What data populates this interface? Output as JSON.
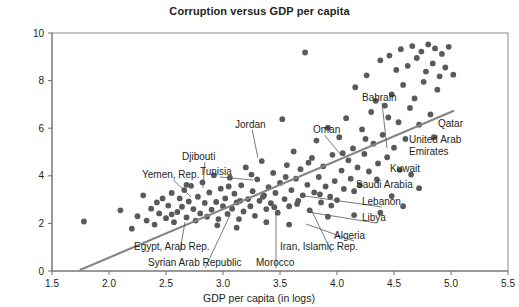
{
  "chart_data": {
    "type": "scatter",
    "title": "Corruption versus GDP per capita",
    "xlabel": "GDP per capita (in logs)",
    "ylabel": "",
    "xlim": [
      1.5,
      5.5
    ],
    "ylim": [
      0,
      10
    ],
    "xticks": [
      "1.5",
      "2.0",
      "2.5",
      "3.0",
      "3.5",
      "4.0",
      "4.5",
      "5.0",
      "5.5"
    ],
    "xtick_values": [
      1.5,
      2.0,
      2.5,
      3.0,
      3.5,
      4.0,
      4.5,
      5.0,
      5.5
    ],
    "yticks": [
      "0",
      "2",
      "4",
      "6",
      "8",
      "10"
    ],
    "ytick_values": [
      0,
      2,
      4,
      6,
      8,
      10
    ],
    "grid": false,
    "legend": "none",
    "marker_color": "#5a5a5a",
    "trend_color": "#848484",
    "trendline": {
      "x": [
        1.75,
        5.02
      ],
      "y": [
        0.05,
        6.72
      ]
    },
    "points": [
      [
        1.78,
        2.08
      ],
      [
        2.1,
        2.55
      ],
      [
        2.2,
        1.78
      ],
      [
        2.25,
        2.3
      ],
      [
        2.33,
        2.12
      ],
      [
        2.37,
        2.62
      ],
      [
        2.4,
        1.95
      ],
      [
        2.44,
        2.42
      ],
      [
        2.47,
        3.05
      ],
      [
        2.5,
        2.22
      ],
      [
        2.52,
        2.75
      ],
      [
        2.55,
        3.28
      ],
      [
        2.57,
        2.05
      ],
      [
        2.6,
        2.48
      ],
      [
        2.62,
        3.05
      ],
      [
        2.64,
        2.7
      ],
      [
        2.66,
        3.4
      ],
      [
        2.68,
        2.25
      ],
      [
        2.7,
        2.92
      ],
      [
        2.72,
        3.58
      ],
      [
        2.74,
        2.6
      ],
      [
        2.76,
        2.12
      ],
      [
        2.78,
        3.12
      ],
      [
        2.8,
        2.42
      ],
      [
        2.82,
        3.72
      ],
      [
        2.84,
        2.86
      ],
      [
        2.86,
        2.28
      ],
      [
        2.88,
        3.3
      ],
      [
        2.9,
        2.58
      ],
      [
        2.92,
        4.02
      ],
      [
        2.94,
        2.9
      ],
      [
        2.96,
        2.18
      ],
      [
        2.98,
        3.46
      ],
      [
        3.0,
        2.72
      ],
      [
        3.02,
        3.05
      ],
      [
        3.04,
        2.4
      ],
      [
        3.06,
        3.92
      ],
      [
        3.08,
        2.62
      ],
      [
        3.1,
        3.25
      ],
      [
        3.12,
        2.88
      ],
      [
        3.14,
        2.18
      ],
      [
        3.16,
        3.6
      ],
      [
        3.18,
        2.5
      ],
      [
        3.2,
        4.35
      ],
      [
        3.22,
        3.02
      ],
      [
        3.24,
        2.72
      ],
      [
        3.26,
        3.35
      ],
      [
        3.28,
        2.32
      ],
      [
        3.3,
        3.85
      ],
      [
        3.32,
        2.95
      ],
      [
        3.34,
        4.62
      ],
      [
        3.36,
        3.18
      ],
      [
        3.38,
        2.6
      ],
      [
        3.4,
        3.52
      ],
      [
        3.42,
        2.85
      ],
      [
        3.44,
        4.12
      ],
      [
        3.46,
        3.28
      ],
      [
        3.48,
        2.45
      ],
      [
        3.5,
        3.7
      ],
      [
        3.52,
        6.38
      ],
      [
        3.54,
        3.02
      ],
      [
        3.56,
        4.45
      ],
      [
        3.58,
        2.72
      ],
      [
        3.6,
        3.4
      ],
      [
        3.62,
        5.02
      ],
      [
        3.64,
        3.88
      ],
      [
        3.66,
        2.95
      ],
      [
        3.68,
        4.28
      ],
      [
        3.7,
        3.18
      ],
      [
        3.72,
        9.18
      ],
      [
        3.74,
        3.62
      ],
      [
        3.76,
        2.55
      ],
      [
        3.78,
        4.75
      ],
      [
        3.8,
        3.3
      ],
      [
        3.82,
        5.48
      ],
      [
        3.84,
        3.95
      ],
      [
        3.86,
        2.88
      ],
      [
        3.88,
        4.4
      ],
      [
        3.9,
        3.55
      ],
      [
        3.92,
        6.02
      ],
      [
        3.94,
        3.12
      ],
      [
        3.96,
        4.88
      ],
      [
        3.98,
        3.78
      ],
      [
        4.0,
        2.98
      ],
      [
        4.02,
        5.62
      ],
      [
        4.04,
        4.22
      ],
      [
        4.06,
        3.45
      ],
      [
        4.08,
        6.42
      ],
      [
        4.1,
        4.65
      ],
      [
        4.12,
        3.88
      ],
      [
        4.14,
        5.15
      ],
      [
        4.16,
        7.72
      ],
      [
        4.18,
        4.35
      ],
      [
        4.2,
        3.62
      ],
      [
        4.22,
        5.95
      ],
      [
        4.24,
        4.92
      ],
      [
        4.26,
        8.22
      ],
      [
        4.28,
        4.18
      ],
      [
        4.3,
        6.68
      ],
      [
        4.32,
        5.35
      ],
      [
        4.34,
        7.15
      ],
      [
        4.36,
        4.52
      ],
      [
        4.38,
        8.85
      ],
      [
        4.4,
        5.72
      ],
      [
        4.42,
        6.95
      ],
      [
        4.44,
        4.78
      ],
      [
        4.46,
        9.05
      ],
      [
        4.48,
        7.42
      ],
      [
        4.5,
        5.18
      ],
      [
        4.52,
        8.45
      ],
      [
        4.54,
        6.25
      ],
      [
        4.56,
        9.32
      ],
      [
        4.58,
        7.82
      ],
      [
        4.6,
        5.55
      ],
      [
        4.62,
        8.62
      ],
      [
        4.64,
        6.85
      ],
      [
        4.66,
        9.45
      ],
      [
        4.68,
        7.25
      ],
      [
        4.7,
        8.95
      ],
      [
        4.72,
        6.15
      ],
      [
        4.74,
        9.22
      ],
      [
        4.76,
        7.95
      ],
      [
        4.78,
        8.38
      ],
      [
        4.8,
        9.52
      ],
      [
        4.82,
        6.58
      ],
      [
        4.84,
        8.72
      ],
      [
        4.86,
        9.35
      ],
      [
        4.88,
        7.62
      ],
      [
        4.9,
        8.18
      ],
      [
        4.92,
        9.12
      ],
      [
        4.95,
        8.55
      ],
      [
        4.98,
        9.42
      ],
      [
        5.02,
        8.25
      ],
      [
        2.3,
        3.18
      ],
      [
        2.42,
        2.88
      ],
      [
        2.55,
        2.38
      ],
      [
        2.68,
        3.62
      ],
      [
        3.05,
        3.55
      ],
      [
        3.15,
        2.95
      ],
      [
        3.25,
        4.05
      ],
      [
        3.35,
        3.12
      ],
      [
        3.45,
        2.68
      ],
      [
        3.55,
        3.95
      ],
      [
        3.65,
        2.82
      ],
      [
        3.75,
        4.55
      ],
      [
        3.85,
        3.22
      ],
      [
        3.95,
        2.75
      ],
      [
        4.05,
        4.95
      ],
      [
        4.15,
        3.35
      ],
      [
        4.25,
        5.55
      ],
      [
        4.35,
        3.85
      ],
      [
        4.45,
        6.45
      ],
      [
        4.55,
        4.25
      ],
      [
        2.95,
        1.92
      ],
      [
        3.12,
        1.82
      ],
      [
        3.38,
        2.05
      ],
      [
        3.58,
        1.95
      ],
      [
        4.38,
        2.45
      ],
      [
        4.48,
        3.15
      ],
      [
        4.58,
        2.72
      ],
      [
        4.15,
        2.35
      ],
      [
        3.92,
        2.28
      ],
      [
        4.65,
        4.05
      ],
      [
        4.72,
        3.48
      ],
      [
        4.85,
        5.62
      ]
    ],
    "annotations": [
      {
        "label": "Bahrain",
        "lx": 362,
        "ly": 101,
        "anchor": "start",
        "px": 387,
        "py": 148,
        "leader": true
      },
      {
        "label": "Qatar",
        "lx": 438,
        "ly": 127,
        "anchor": "start",
        "px": 432,
        "py": 131,
        "leader": false
      },
      {
        "label": "United Arab",
        "lx": 409,
        "ly": 143,
        "anchor": "start",
        "px": 0,
        "py": 0,
        "leader": false
      },
      {
        "label": "Emirates",
        "lx": 409,
        "ly": 155,
        "anchor": "start",
        "px": 0,
        "py": 0,
        "leader": false
      },
      {
        "label": "Kuwait",
        "lx": 390,
        "ly": 172,
        "anchor": "start",
        "px": 385,
        "py": 169,
        "leader": false
      },
      {
        "label": "Saudi Arabia",
        "lx": 356,
        "ly": 188,
        "anchor": "start",
        "px": 351,
        "py": 185,
        "leader": false
      },
      {
        "label": "Oman",
        "lx": 313,
        "ly": 133,
        "anchor": "start",
        "px": 341,
        "py": 155,
        "leader": true
      },
      {
        "label": "Jordan",
        "lx": 235,
        "ly": 128,
        "anchor": "start",
        "px": 258,
        "py": 158,
        "leader": true
      },
      {
        "label": "Lebanon",
        "lx": 362,
        "ly": 205,
        "anchor": "start",
        "px": 305,
        "py": 196,
        "leader": true
      },
      {
        "label": "Libya",
        "lx": 362,
        "ly": 221,
        "anchor": "start",
        "px": 308,
        "py": 212,
        "leader": true
      },
      {
        "label": "Algeria",
        "lx": 334,
        "ly": 239,
        "anchor": "start",
        "px": 306,
        "py": 224,
        "leader": true
      },
      {
        "label": "Tunisia",
        "lx": 200,
        "ly": 175,
        "anchor": "start",
        "px": 253,
        "py": 180,
        "leader": true
      },
      {
        "label": "Djibouti",
        "lx": 182,
        "ly": 160,
        "anchor": "start",
        "px": 203,
        "py": 188,
        "leader": true
      },
      {
        "label": "Yemen, Rep.",
        "lx": 142,
        "ly": 178,
        "anchor": "start",
        "px": 191,
        "py": 197,
        "leader": true
      },
      {
        "label": "Egypt, Arab Rep.",
        "lx": 134,
        "ly": 250,
        "anchor": "start",
        "px": 185,
        "py": 222,
        "leader": true
      },
      {
        "label": "Syrian Arab Republic",
        "lx": 148,
        "ly": 266,
        "anchor": "start",
        "px": 230,
        "py": 215,
        "leader": true
      },
      {
        "label": "Morocco",
        "lx": 256,
        "ly": 266,
        "anchor": "start",
        "px": 276,
        "py": 212,
        "leader": true
      },
      {
        "label": "Iran, Islamic Rep.",
        "lx": 280,
        "ly": 250,
        "anchor": "start",
        "px": 311,
        "py": 209,
        "leader": true
      }
    ]
  }
}
